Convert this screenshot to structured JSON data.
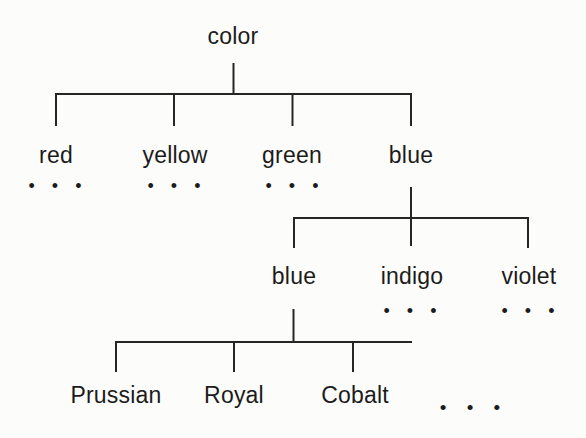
{
  "colors": {
    "background": "#fcfcfa",
    "line": "#262626",
    "text": "#1c1c1c"
  },
  "tree": {
    "root": {
      "label": "color"
    },
    "level1": [
      {
        "label": "red",
        "ellipsis": "• • •"
      },
      {
        "label": "yellow",
        "ellipsis": "• • •"
      },
      {
        "label": "green",
        "ellipsis": "• • •"
      },
      {
        "label": "blue"
      }
    ],
    "level2_parent": "blue",
    "level2": [
      {
        "label": "blue"
      },
      {
        "label": "indigo",
        "ellipsis": "• • •"
      },
      {
        "label": "violet",
        "ellipsis": "• • •"
      }
    ],
    "level3_parent": "blue",
    "level3": [
      {
        "label": "Prussian"
      },
      {
        "label": "Royal"
      },
      {
        "label": "Cobalt"
      },
      {
        "label": "• • •",
        "is_ellipsis": true
      }
    ]
  }
}
